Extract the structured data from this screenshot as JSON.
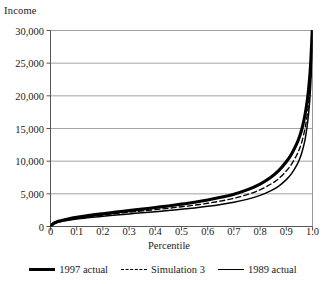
{
  "chart_data": {
    "type": "line",
    "title": "",
    "ylabel": "Income",
    "xlabel": "Percentile",
    "xlim": [
      0,
      1.0
    ],
    "ylim": [
      0,
      30000
    ],
    "grid": "horizontal",
    "legend_position": "bottom",
    "y_ticks": [
      {
        "value": 0,
        "label": "0"
      },
      {
        "value": 5000,
        "label": "5,000"
      },
      {
        "value": 10000,
        "label": "10,000"
      },
      {
        "value": 15000,
        "label": "15,000"
      },
      {
        "value": 20000,
        "label": "20,000"
      },
      {
        "value": 25000,
        "label": "25,000"
      },
      {
        "value": 30000,
        "label": "30,000"
      }
    ],
    "x_ticks": [
      {
        "value": 0.0,
        "label": "0"
      },
      {
        "value": 0.1,
        "label": "0.1"
      },
      {
        "value": 0.2,
        "label": "0.2"
      },
      {
        "value": 0.3,
        "label": "0.3"
      },
      {
        "value": 0.4,
        "label": "0.4"
      },
      {
        "value": 0.5,
        "label": "0.5"
      },
      {
        "value": 0.6,
        "label": "0.6"
      },
      {
        "value": 0.7,
        "label": "0.7"
      },
      {
        "value": 0.8,
        "label": "0.8"
      },
      {
        "value": 0.9,
        "label": "0.9"
      },
      {
        "value": 1.0,
        "label": "1.0"
      }
    ],
    "x": [
      0.0,
      0.01,
      0.02,
      0.03,
      0.05,
      0.075,
      0.1,
      0.15,
      0.2,
      0.25,
      0.3,
      0.35,
      0.4,
      0.45,
      0.5,
      0.55,
      0.6,
      0.65,
      0.7,
      0.75,
      0.8,
      0.84,
      0.87,
      0.9,
      0.92,
      0.94,
      0.95,
      0.96,
      0.97,
      0.975,
      0.98,
      0.985,
      0.99,
      0.993,
      0.995,
      0.997,
      0.999,
      1.0
    ],
    "series": [
      {
        "name": "1997 actual",
        "style": "solid",
        "width": 3.1,
        "color": "#000000",
        "values": [
          0,
          420,
          640,
          790,
          1000,
          1220,
          1400,
          1700,
          1960,
          2200,
          2430,
          2660,
          2900,
          3150,
          3420,
          3720,
          4060,
          4460,
          4950,
          5600,
          6500,
          7500,
          8500,
          9900,
          11100,
          12700,
          13700,
          15000,
          16800,
          17900,
          19300,
          21000,
          23200,
          25000,
          26500,
          28200,
          30000,
          31500
        ]
      },
      {
        "name": "Simulation 3",
        "style": "dashed",
        "width": 1.35,
        "color": "#000000",
        "values": [
          0,
          380,
          580,
          720,
          920,
          1110,
          1270,
          1540,
          1770,
          1980,
          2180,
          2380,
          2580,
          2790,
          3020,
          3270,
          3560,
          3900,
          4320,
          4870,
          5620,
          6460,
          7300,
          8500,
          9540,
          10950,
          11850,
          13050,
          14700,
          15800,
          17150,
          18800,
          21000,
          22900,
          24500,
          26400,
          28900,
          30500
        ]
      },
      {
        "name": "1989 actual",
        "style": "solid",
        "width": 1.5,
        "color": "#000000",
        "values": [
          0,
          340,
          520,
          650,
          830,
          1000,
          1140,
          1380,
          1580,
          1760,
          1930,
          2100,
          2270,
          2450,
          2640,
          2850,
          3090,
          3370,
          3710,
          4150,
          4760,
          5450,
          6150,
          7180,
          8100,
          9400,
          10250,
          11400,
          13000,
          14100,
          15500,
          17200,
          19600,
          21600,
          23400,
          25600,
          28400,
          30200
        ]
      }
    ]
  },
  "legend": {
    "items": [
      {
        "label": "1997 actual"
      },
      {
        "label": "Simulation 3"
      },
      {
        "label": "1989 actual"
      }
    ]
  }
}
